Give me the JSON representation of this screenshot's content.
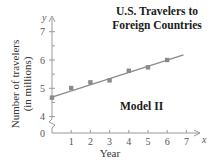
{
  "chart_data": {
    "type": "scatter",
    "title": "U.S. Travelers to Foreign Countries",
    "title_lines": [
      "U.S. Travelers to",
      "Foreign Countries"
    ],
    "xlabel": "Year",
    "ylabel": "Number of travelers (in millions)",
    "ylabel_lines": [
      "Number of travelers",
      "(in millions)"
    ],
    "x_axis_symbol": "x",
    "y_axis_symbol": "y",
    "annotation": "Model II",
    "x": [
      0,
      1,
      2,
      3,
      4,
      5,
      6
    ],
    "values": [
      4.67,
      5.01,
      5.21,
      5.28,
      5.62,
      5.74,
      6.0
    ],
    "series": [
      {
        "name": "Data points",
        "kind": "scatter",
        "x": [
          0,
          1,
          2,
          3,
          4,
          5,
          6
        ],
        "values": [
          4.67,
          5.01,
          5.21,
          5.28,
          5.62,
          5.74,
          6.0
        ]
      },
      {
        "name": "Model II (linear fit)",
        "kind": "line",
        "x": [
          0,
          6.85
        ],
        "values": [
          4.69,
          6.18
        ]
      }
    ],
    "x_ticks": [
      "0",
      "1",
      "2",
      "3",
      "4",
      "5",
      "6",
      "7"
    ],
    "y_ticks": [
      "4",
      "5",
      "6",
      "7"
    ],
    "y_origin_label": "0",
    "xlim": [
      0,
      7
    ],
    "ylim": [
      4,
      7
    ],
    "y_axis_break": true,
    "grid": false,
    "legend": "none",
    "colors": {
      "line": "#8a8a8a",
      "marker": "#8a8a8a",
      "axis": "#9a9a9a",
      "text": "#222222"
    }
  }
}
